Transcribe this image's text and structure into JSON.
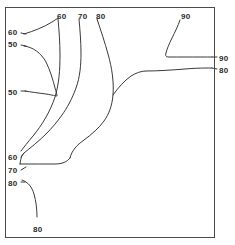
{
  "figure": {
    "title": "",
    "background_color": "#ffffff",
    "frame_color": "#4a4a4a",
    "line_color": "#3a3a3a",
    "width": 235,
    "height": 245
  },
  "chart_data": {
    "type": "line",
    "subtype": "contour-map",
    "title": "",
    "xlabel": "",
    "ylabel": "",
    "xlim": [
      0,
      1
    ],
    "ylim": [
      0,
      1
    ],
    "grid": false,
    "legend": null,
    "axis_ticks": {
      "x": [],
      "y": []
    },
    "contour_levels": [
      50,
      60,
      70,
      80,
      90
    ],
    "annotations": [
      {
        "id": "label-top-60",
        "text": "60",
        "x": 57,
        "y": 12,
        "level": 60,
        "placement": "top"
      },
      {
        "id": "label-top-70",
        "text": "70",
        "x": 78,
        "y": 12,
        "level": 70,
        "placement": "top"
      },
      {
        "id": "label-top-80",
        "text": "80",
        "x": 96,
        "y": 12,
        "level": 80,
        "placement": "top"
      },
      {
        "id": "label-top-90",
        "text": "90",
        "x": 181,
        "y": 12,
        "level": 90,
        "placement": "top"
      },
      {
        "id": "label-left-60-upper",
        "text": "60",
        "x": 8,
        "y": 28,
        "level": 60,
        "placement": "left"
      },
      {
        "id": "label-left-50-upper",
        "text": "50",
        "x": 8,
        "y": 40,
        "level": 50,
        "placement": "left"
      },
      {
        "id": "label-left-50-lower",
        "text": "50",
        "x": 8,
        "y": 88,
        "level": 50,
        "placement": "left"
      },
      {
        "id": "label-left-60-lower",
        "text": "60",
        "x": 8,
        "y": 153,
        "level": 60,
        "placement": "left"
      },
      {
        "id": "label-left-70",
        "text": "70",
        "x": 8,
        "y": 166,
        "level": 70,
        "placement": "left"
      },
      {
        "id": "label-left-80",
        "text": "80",
        "x": 8,
        "y": 179,
        "level": 80,
        "placement": "left"
      },
      {
        "id": "label-right-90",
        "text": "90",
        "x": 219,
        "y": 54,
        "level": 90,
        "placement": "right"
      },
      {
        "id": "label-right-80",
        "text": "80",
        "x": 219,
        "y": 66,
        "level": 80,
        "placement": "right"
      },
      {
        "id": "label-bottom-80",
        "text": "80",
        "x": 33,
        "y": 225,
        "level": 80,
        "placement": "bottom"
      }
    ],
    "contours": [
      {
        "id": "contour-60-left-branch",
        "level": 60,
        "path": "M 24 34 C 34 31 44 27 52 22 C 55 20 57 19 58 18",
        "description": "short contour from left-upper 60 label rising to top 60 label"
      },
      {
        "id": "contour-50-loop",
        "level": 50,
        "path": "M 24 46 C 33 47 41 53 46 62 C 50 70 53 80 55 88 C 56 92 57 94 57 96 C 56 96 52 95 46 94 C 38 93 31 92 25 91",
        "description": "closed-ended 50 contour loop opening to the left edge"
      },
      {
        "id": "contour-60-main",
        "level": 60,
        "path": "M 58 19 C 59 30 60 42 60 55 C 60 70 59 84 55 97 C 50 112 42 125 33 136 C 28 142 24 147 21 151",
        "description": "main 60 contour from top label descending and sweeping left to lower-left 60 label"
      },
      {
        "id": "contour-70-main",
        "level": 70,
        "path": "M 79 19 C 80 30 81 42 81 53 C 81 65 80 77 76 88 C 72 99 67 108 62 115 C 57 122 52 128 46 134 C 38 142 30 148 24 153 C 22 155 21 157 20 164",
        "description": "70 contour from top label curving down and left to the 70 left label"
      },
      {
        "id": "contour-70-tail",
        "level": 70,
        "path": "M 20 164 C 32 164 45 164 55 164 C 62 164 67 162 70 158",
        "description": "horizontal tail of the 70 contour near the lower-left"
      },
      {
        "id": "contour-80-main",
        "level": 80,
        "path": "M 97 19 C 101 31 105 43 108 54 C 112 68 114 82 113 95 C 112 106 109 114 104 121 C 99 128 92 134 84 140 C 77 145 72 150 70 158",
        "description": "80 contour from top label sweeping down and back to the left"
      },
      {
        "id": "contour-80-right",
        "level": 80,
        "path": "M 113 95 C 118 88 124 81 131 76 C 136 73 141 71 146 71 C 158 71 172 70 185 69 C 196 68 206 68 212 68",
        "description": "right branch of 80 contour forming a valley to the right edge"
      },
      {
        "id": "contour-90-main",
        "level": 90,
        "path": "M 180 20 C 178 26 175 32 172 38 C 169 44 167 49 166 53 C 165 56 166 57 169 57 C 178 57 190 57 200 57 C 206 57 210 57 212 57",
        "description": "90 contour hooking from the top label right to the right edge"
      },
      {
        "id": "contour-80-bottomleft",
        "level": 80,
        "path": "M 22 180 C 28 182 32 187 34 194 C 36 201 37 209 37 217",
        "description": "80 contour from the left edge curving down toward the bottom 80 label"
      }
    ],
    "leaders": [
      {
        "id": "leader-left-60-upper",
        "x1": 21,
        "y1": 33,
        "x2": 26,
        "y2": 34
      },
      {
        "id": "leader-left-50-upper",
        "x1": 21,
        "y1": 45,
        "x2": 26,
        "y2": 46
      },
      {
        "id": "leader-left-50-lower",
        "x1": 21,
        "y1": 91,
        "x2": 26,
        "y2": 91
      },
      {
        "id": "leader-left-60-lower",
        "x1": 21,
        "y1": 157,
        "x2": 24,
        "y2": 153
      },
      {
        "id": "leader-left-70",
        "x1": 21,
        "y1": 170,
        "x2": 26,
        "y2": 167
      },
      {
        "id": "leader-left-80",
        "x1": 21,
        "y1": 182,
        "x2": 25,
        "y2": 182
      },
      {
        "id": "leader-right-90",
        "x1": 212,
        "y1": 57,
        "x2": 217,
        "y2": 57
      },
      {
        "id": "leader-right-80",
        "x1": 212,
        "y1": 68,
        "x2": 217,
        "y2": 69
      }
    ]
  },
  "frame": {
    "x": 5,
    "y": 7,
    "width": 209,
    "height": 230
  }
}
